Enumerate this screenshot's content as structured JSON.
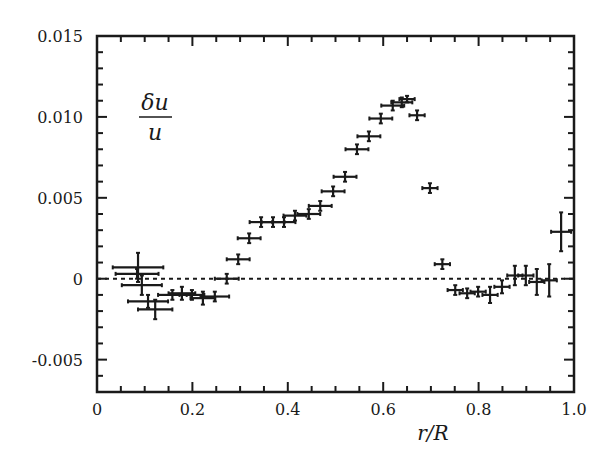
{
  "chart_data": {
    "type": "scatter",
    "title": "",
    "xlabel": "r/R",
    "ylabel": "δu/u",
    "ylabel_numerator": "δu",
    "ylabel_denominator": "u",
    "xlim": [
      0,
      1.0
    ],
    "ylim": [
      -0.007,
      0.015
    ],
    "x_ticks": [
      0,
      0.2,
      0.4,
      0.6,
      0.8,
      1.0
    ],
    "x_tick_labels": [
      "0",
      "0.2",
      "0.4",
      "0.6",
      "0.8",
      "1.0"
    ],
    "x_minor_step": 0.05,
    "y_ticks": [
      -0.005,
      0,
      0.005,
      0.01,
      0.015
    ],
    "y_tick_labels": [
      "-0.005",
      "0",
      "0.005",
      "0.010",
      "0.015"
    ],
    "y_minor_step": 0.001,
    "grid": false,
    "reference_line": {
      "y": 0,
      "style": "dotted"
    },
    "marker_color": "#1a1a1a",
    "series": [
      {
        "name": "δu/u",
        "points": [
          {
            "x": 0.086,
            "y": 0.0007,
            "xerr": 0.053,
            "yerr": 0.0009
          },
          {
            "x": 0.084,
            "y": 0.0003,
            "xerr": 0.045,
            "yerr": 0.0003
          },
          {
            "x": 0.094,
            "y": -0.0004,
            "xerr": 0.042,
            "yerr": 0.0006
          },
          {
            "x": 0.107,
            "y": -0.0014,
            "xerr": 0.042,
            "yerr": 0.0004
          },
          {
            "x": 0.122,
            "y": -0.0019,
            "xerr": 0.036,
            "yerr": 0.0006
          },
          {
            "x": 0.158,
            "y": -0.001,
            "xerr": 0.03,
            "yerr": 0.0003
          },
          {
            "x": 0.178,
            "y": -0.0009,
            "xerr": 0.028,
            "yerr": 0.0004
          },
          {
            "x": 0.199,
            "y": -0.001,
            "xerr": 0.026,
            "yerr": 0.0003
          },
          {
            "x": 0.222,
            "y": -0.0012,
            "xerr": 0.026,
            "yerr": 0.0004
          },
          {
            "x": 0.247,
            "y": -0.0011,
            "xerr": 0.03,
            "yerr": 0.0003
          },
          {
            "x": 0.272,
            "y": 0.0,
            "xerr": 0.025,
            "yerr": 0.0003
          },
          {
            "x": 0.296,
            "y": 0.0012,
            "xerr": 0.024,
            "yerr": 0.0003
          },
          {
            "x": 0.319,
            "y": 0.0025,
            "xerr": 0.024,
            "yerr": 0.0003
          },
          {
            "x": 0.344,
            "y": 0.0035,
            "xerr": 0.024,
            "yerr": 0.0003
          },
          {
            "x": 0.369,
            "y": 0.0035,
            "xerr": 0.024,
            "yerr": 0.0003
          },
          {
            "x": 0.392,
            "y": 0.0035,
            "xerr": 0.024,
            "yerr": 0.0003
          },
          {
            "x": 0.415,
            "y": 0.0039,
            "xerr": 0.024,
            "yerr": 0.0003
          },
          {
            "x": 0.444,
            "y": 0.004,
            "xerr": 0.024,
            "yerr": 0.0003
          },
          {
            "x": 0.468,
            "y": 0.0045,
            "xerr": 0.024,
            "yerr": 0.0003
          },
          {
            "x": 0.495,
            "y": 0.0054,
            "xerr": 0.024,
            "yerr": 0.0003
          },
          {
            "x": 0.52,
            "y": 0.0063,
            "xerr": 0.024,
            "yerr": 0.0003
          },
          {
            "x": 0.545,
            "y": 0.008,
            "xerr": 0.024,
            "yerr": 0.0003
          },
          {
            "x": 0.57,
            "y": 0.0088,
            "xerr": 0.024,
            "yerr": 0.0003
          },
          {
            "x": 0.595,
            "y": 0.0099,
            "xerr": 0.024,
            "yerr": 0.0003
          },
          {
            "x": 0.62,
            "y": 0.0107,
            "xerr": 0.024,
            "yerr": 0.0003
          },
          {
            "x": 0.639,
            "y": 0.0109,
            "xerr": 0.022,
            "yerr": 0.0003
          },
          {
            "x": 0.65,
            "y": 0.0111,
            "xerr": 0.016,
            "yerr": 0.0002
          },
          {
            "x": 0.671,
            "y": 0.0101,
            "xerr": 0.016,
            "yerr": 0.0003
          },
          {
            "x": 0.698,
            "y": 0.0056,
            "xerr": 0.016,
            "yerr": 0.0003
          },
          {
            "x": 0.724,
            "y": 0.0009,
            "xerr": 0.016,
            "yerr": 0.0003
          },
          {
            "x": 0.751,
            "y": -0.0007,
            "xerr": 0.016,
            "yerr": 0.0003
          },
          {
            "x": 0.776,
            "y": -0.0009,
            "xerr": 0.016,
            "yerr": 0.0003
          },
          {
            "x": 0.799,
            "y": -0.0008,
            "xerr": 0.016,
            "yerr": 0.0003
          },
          {
            "x": 0.824,
            "y": -0.001,
            "xerr": 0.016,
            "yerr": 0.0005
          },
          {
            "x": 0.849,
            "y": -0.0005,
            "xerr": 0.016,
            "yerr": 0.0004
          },
          {
            "x": 0.876,
            "y": 0.0002,
            "xerr": 0.016,
            "yerr": 0.0006
          },
          {
            "x": 0.899,
            "y": 0.0002,
            "xerr": 0.016,
            "yerr": 0.0006
          },
          {
            "x": 0.922,
            "y": -0.0002,
            "xerr": 0.016,
            "yerr": 0.0008
          },
          {
            "x": 0.948,
            "y": -0.0001,
            "xerr": 0.016,
            "yerr": 0.001
          },
          {
            "x": 0.973,
            "y": 0.0029,
            "xerr": 0.021,
            "yerr": 0.0012
          }
        ]
      }
    ]
  }
}
